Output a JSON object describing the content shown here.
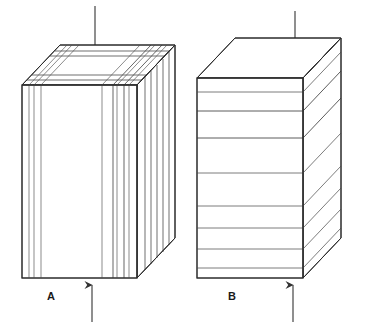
{
  "figure": {
    "background_color": "#ffffff",
    "line_color": "#2b2b2b",
    "thin_line_color": "#6e6e6e",
    "arrow_color": "#333333"
  },
  "panels": [
    {
      "id": "A",
      "label": "A",
      "label_position": {
        "x": 51,
        "y": 300
      },
      "lamination_orientation": "vertical",
      "lamination_count": 9,
      "description": "Block with laminations parallel to the applied load",
      "top_arrow": {
        "name": "load-arrow-top-a",
        "direction": "down",
        "x": 95,
        "y_start": 6,
        "y_end": 52
      },
      "bottom_arrow": {
        "name": "load-arrow-bottom-a",
        "direction": "up",
        "x": 92,
        "y_start": 322,
        "y_end": 283
      },
      "front_face": {
        "left": 22,
        "right": 137,
        "top": 85,
        "bottom": 278
      },
      "depth_offset": {
        "dx": 38,
        "dy": -40
      },
      "front_lamination_x": [
        22,
        29,
        34,
        41,
        102,
        113,
        117,
        124,
        129,
        137
      ],
      "side_lamination_t": [
        0.0,
        0.2,
        0.33,
        0.55,
        0.72,
        0.88,
        1.0
      ]
    },
    {
      "id": "B",
      "label": "B",
      "label_position": {
        "x": 232,
        "y": 300
      },
      "lamination_orientation": "horizontal",
      "lamination_count": 8,
      "description": "Block with laminations perpendicular to the applied load",
      "top_arrow": {
        "name": "load-arrow-top-b",
        "direction": "down",
        "x": 295,
        "y_start": 11,
        "y_end": 57
      },
      "bottom_arrow": {
        "name": "load-arrow-bottom-b",
        "direction": "up",
        "x": 293,
        "y_start": 322,
        "y_end": 283
      },
      "front_face": {
        "left": 197,
        "right": 303,
        "top": 78,
        "bottom": 278
      },
      "depth_offset": {
        "dx": 38,
        "dy": -40
      },
      "front_lamination_y": [
        78,
        92,
        111,
        138,
        173,
        206,
        228,
        249,
        268,
        278
      ]
    }
  ]
}
